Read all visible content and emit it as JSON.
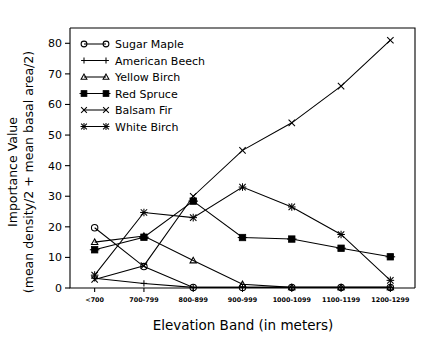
{
  "chart_data": {
    "type": "line",
    "title": "",
    "xlabel": "Elevation Band (in meters)",
    "ylabel": "Importance Value\n(mean density/2 + mean basal area/2)",
    "ylabel_line1": "Importance Value",
    "ylabel_line2": "(mean density/2 + mean basal area/2)",
    "categories": [
      "<700",
      "700-799",
      "800-899",
      "900-999",
      "1000-1099",
      "1100-1199",
      "1200-1299"
    ],
    "ylim": [
      0,
      85
    ],
    "yticks": [
      0,
      10,
      20,
      30,
      40,
      50,
      60,
      70,
      80
    ],
    "ytick_labels": [
      "0",
      "10",
      "20",
      "30",
      "40",
      "50",
      "60",
      "70",
      "80"
    ],
    "grid": false,
    "legend_position": "upper-left-inside",
    "series": [
      {
        "name": "Sugar Maple",
        "marker": "circle",
        "values": [
          19.7,
          7.0,
          0.2,
          0.2,
          0.2,
          0.2,
          0.2
        ]
      },
      {
        "name": "American Beech",
        "marker": "plus",
        "values": [
          3.2,
          1.5,
          0.2,
          0.2,
          0.2,
          0.2,
          0.2
        ]
      },
      {
        "name": "Yellow Birch",
        "marker": "triangle",
        "values": [
          15.0,
          17.0,
          9.0,
          1.2,
          0.2,
          0.2,
          0.2
        ]
      },
      {
        "name": "Red Spruce",
        "marker": "square",
        "values": [
          12.5,
          16.6,
          28.4,
          16.5,
          16.0,
          13.0,
          10.2
        ]
      },
      {
        "name": "Balsam Fir",
        "marker": "cross",
        "values": [
          2.8,
          7.3,
          30.0,
          45.0,
          54.0,
          66.0,
          81.0
        ]
      },
      {
        "name": "White Birch",
        "marker": "star",
        "values": [
          4.2,
          24.7,
          23.0,
          33.0,
          26.5,
          17.5,
          2.5
        ]
      }
    ]
  }
}
